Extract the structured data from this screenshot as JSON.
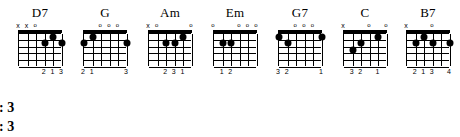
{
  "sheet": {
    "background": "#ffffff",
    "ink": "#000000",
    "chords": [
      {
        "name": "D7",
        "left": 8,
        "string_markers": [
          "x",
          "x",
          "o",
          "",
          "",
          ""
        ],
        "dots": [
          {
            "string": 3,
            "fret": 2
          },
          {
            "string": 2,
            "fret": 1
          },
          {
            "string": 1,
            "fret": 2
          }
        ],
        "fingering": [
          {
            "string": 3,
            "digit": "2"
          },
          {
            "string": 2,
            "digit": "1"
          },
          {
            "string": 1,
            "digit": "3"
          }
        ]
      },
      {
        "name": "G",
        "left": 73,
        "string_markers": [
          "",
          "",
          "o",
          "o",
          "o",
          ""
        ],
        "dots": [
          {
            "string": 6,
            "fret": 2
          },
          {
            "string": 5,
            "fret": 1
          },
          {
            "string": 1,
            "fret": 2
          }
        ],
        "fingering": [
          {
            "string": 6,
            "digit": "2"
          },
          {
            "string": 5,
            "digit": "1"
          },
          {
            "string": 1,
            "digit": "3"
          }
        ]
      },
      {
        "name": "Am",
        "left": 138,
        "string_markers": [
          "x",
          "o",
          "",
          "",
          "",
          "o"
        ],
        "dots": [
          {
            "string": 4,
            "fret": 2
          },
          {
            "string": 3,
            "fret": 2
          },
          {
            "string": 2,
            "fret": 1
          }
        ],
        "fingering": [
          {
            "string": 4,
            "digit": "2"
          },
          {
            "string": 3,
            "digit": "3"
          },
          {
            "string": 2,
            "digit": "1"
          }
        ]
      },
      {
        "name": "Em",
        "left": 203,
        "string_markers": [
          "o",
          "",
          "",
          "o",
          "o",
          "o"
        ],
        "dots": [
          {
            "string": 5,
            "fret": 2
          },
          {
            "string": 4,
            "fret": 2
          }
        ],
        "fingering": [
          {
            "string": 5,
            "digit": "1"
          },
          {
            "string": 4,
            "digit": "2"
          }
        ]
      },
      {
        "name": "G7",
        "left": 268,
        "string_markers": [
          "",
          "",
          "o",
          "o",
          "o",
          ""
        ],
        "dots": [
          {
            "string": 6,
            "fret": 1
          },
          {
            "string": 5,
            "fret": 2
          },
          {
            "string": 1,
            "fret": 1
          }
        ],
        "fingering": [
          {
            "string": 6,
            "digit": "3"
          },
          {
            "string": 5,
            "digit": "2"
          },
          {
            "string": 1,
            "digit": "1"
          }
        ]
      },
      {
        "name": "C",
        "left": 333,
        "string_markers": [
          "x",
          "",
          "",
          "o",
          "",
          "o"
        ],
        "dots": [
          {
            "string": 5,
            "fret": 3
          },
          {
            "string": 4,
            "fret": 2
          },
          {
            "string": 2,
            "fret": 1
          }
        ],
        "fingering": [
          {
            "string": 5,
            "digit": "3"
          },
          {
            "string": 4,
            "digit": "2"
          },
          {
            "string": 2,
            "digit": "1"
          }
        ]
      },
      {
        "name": "B7",
        "left": 396,
        "string_markers": [
          "x",
          "",
          "",
          "o",
          "",
          ""
        ],
        "dots": [
          {
            "string": 5,
            "fret": 2
          },
          {
            "string": 4,
            "fret": 1
          },
          {
            "string": 3,
            "fret": 2
          },
          {
            "string": 1,
            "fret": 2
          }
        ],
        "fingering": [
          {
            "string": 5,
            "digit": "2"
          },
          {
            "string": 4,
            "digit": "1"
          },
          {
            "string": 3,
            "digit": "3"
          },
          {
            "string": 1,
            "digit": "4"
          }
        ]
      }
    ]
  },
  "notes": {
    "lines": [
      "Pattern: 3",
      "Pattern: 3"
    ]
  }
}
